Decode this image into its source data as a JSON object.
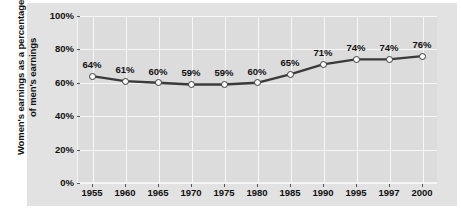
{
  "chart_data": {
    "type": "line",
    "title": "",
    "xlabel": "",
    "ylabel": "Women's earnings as a percentage of men's earnings",
    "ylabel_line1": "Women's earnings as a percentage",
    "ylabel_line2": "of men's earnings",
    "categories": [
      "1955",
      "1960",
      "1965",
      "1970",
      "1975",
      "1980",
      "1985",
      "1990",
      "1995",
      "1997",
      "2000"
    ],
    "values": [
      64,
      61,
      60,
      59,
      59,
      60,
      65,
      71,
      74,
      74,
      76
    ],
    "point_labels": [
      "64%",
      "61%",
      "60%",
      "59%",
      "59%",
      "60%",
      "65%",
      "71%",
      "74%",
      "74%",
      "76%"
    ],
    "ylim": [
      0,
      100
    ],
    "yticks": [
      0,
      20,
      40,
      60,
      80,
      100
    ],
    "ytick_labels": [
      "0%",
      "20%",
      "40%",
      "60%",
      "80%",
      "100%"
    ],
    "grid": true,
    "legend": "none",
    "colors": {
      "line": "#3a3a3a",
      "marker_fill": "#ffffff",
      "marker_stroke": "#3a3a3a",
      "plot_background": "#dcdcdc",
      "card_background": "#e2e2e2",
      "gridline": "#f7f7f7",
      "text": "#111111"
    }
  }
}
